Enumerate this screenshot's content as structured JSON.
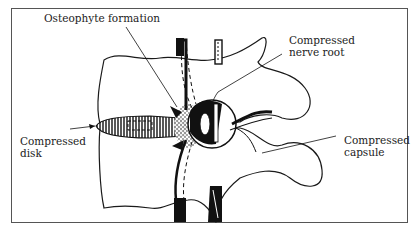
{
  "figure": {
    "labels": {
      "osteophyte": "Osteophyte formation",
      "nerve_root": "Compressed\nnerve root",
      "disk": "Compressed\ndisk",
      "capsule": "Compressed\ncapsule"
    },
    "colors": {
      "ink": "#1a1a1a",
      "frame": "#555555",
      "background": "#ffffff"
    }
  }
}
